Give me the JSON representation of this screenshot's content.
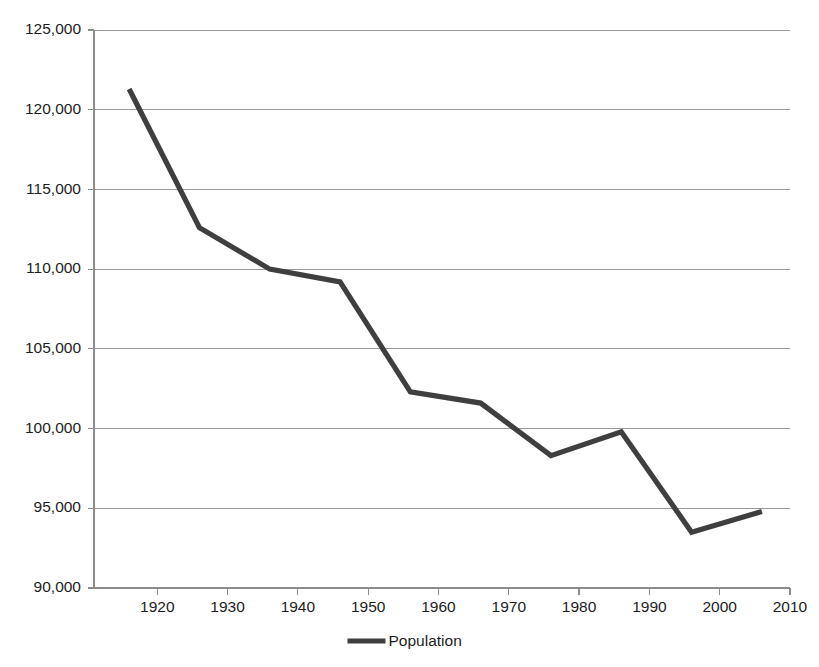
{
  "chart_data": {
    "type": "line",
    "title": "",
    "subtitle": "",
    "xlabel": "",
    "ylabel": "",
    "legend": [
      "Population"
    ],
    "legend_position": "bottom",
    "grid": true,
    "grid_axis": "y",
    "line_color": "#3f3f3f",
    "grid_color": "#9a9a9a",
    "axis_color": "#8c8c8c",
    "background_color": "#ffffff",
    "xlim": [
      1911,
      2010
    ],
    "ylim": [
      90000,
      125000
    ],
    "x": [
      1916,
      1926,
      1936,
      1946,
      1956,
      1966,
      1976,
      1986,
      1996,
      2006
    ],
    "series": [
      {
        "name": "Population",
        "values": [
          121300,
          112600,
          110000,
          109200,
          102300,
          101600,
          98300,
          99800,
          93500,
          94800
        ]
      }
    ],
    "ytick_values": [
      90000,
      95000,
      100000,
      105000,
      110000,
      115000,
      120000,
      125000
    ],
    "ytick_labels": [
      "90,000",
      "95,000",
      "100,000",
      "105,000",
      "110,000",
      "115,000",
      "120,000",
      "125,000"
    ],
    "xtick_values": [
      1920,
      1930,
      1940,
      1950,
      1960,
      1970,
      1980,
      1990,
      2000,
      2010
    ],
    "xtick_labels": [
      "1920",
      "1930",
      "1940",
      "1950",
      "1960",
      "1970",
      "1980",
      "1990",
      "2000",
      "2010"
    ]
  },
  "legend": {
    "series_label": "Population"
  }
}
